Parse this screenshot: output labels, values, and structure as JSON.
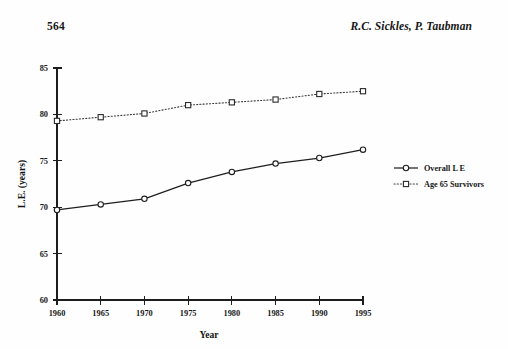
{
  "page": {
    "folio": "564",
    "authors": "R.C. Sickles, P. Taubman"
  },
  "chart_data": {
    "type": "line",
    "title": "",
    "xlabel": "Year",
    "ylabel": "L.E. (years)",
    "x": [
      1960,
      1965,
      1970,
      1975,
      1980,
      1985,
      1990,
      1995
    ],
    "xtick_labels": [
      "1960",
      "1965",
      "1970",
      "1975",
      "1980",
      "1985",
      "1990",
      "1995"
    ],
    "ytick_labels": [
      "60",
      "65",
      "70",
      "75",
      "80",
      "85"
    ],
    "yticks": [
      60,
      65,
      70,
      75,
      80,
      85
    ],
    "xlim": [
      1960,
      1995
    ],
    "ylim": [
      60,
      85
    ],
    "grid": false,
    "legend_position": "right",
    "series": [
      {
        "name": "Overall L E",
        "marker": "circle-open",
        "linestyle": "solid",
        "color": "#1f1f1f",
        "values": [
          69.7,
          70.3,
          70.9,
          72.6,
          73.8,
          74.7,
          75.3,
          76.2
        ]
      },
      {
        "name": "Age 65 Survivors",
        "marker": "square-open",
        "linestyle": "dotted",
        "color": "#2b2b2b",
        "values": [
          79.3,
          79.7,
          80.1,
          81.0,
          81.3,
          81.6,
          82.2,
          82.5
        ]
      }
    ]
  }
}
